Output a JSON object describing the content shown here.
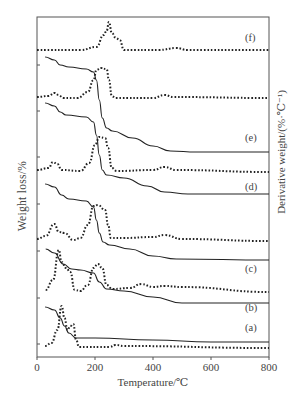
{
  "chart_data": {
    "type": "line",
    "title": "",
    "xlabel": "Temperature/℃",
    "ylabel_left": "Weight loss/%",
    "ylabel_right": "Derivative weight/(%·℃⁻¹)",
    "xlim": [
      0,
      800
    ],
    "x_ticks": [
      0,
      200,
      400,
      600,
      800
    ],
    "grid": false,
    "legend": "inline labels at right end of each curve pair",
    "series": [
      {
        "name": "(f) DTG",
        "style": "dotted",
        "points": [
          [
            0,
            50
          ],
          [
            150,
            50
          ],
          [
            205,
            47
          ],
          [
            230,
            35
          ],
          [
            240,
            31
          ],
          [
            248,
            22
          ],
          [
            258,
            33
          ],
          [
            272,
            38
          ],
          [
            285,
            40
          ],
          [
            300,
            50
          ],
          [
            420,
            50
          ],
          [
            480,
            48
          ],
          [
            520,
            50
          ],
          [
            800,
            50
          ]
        ]
      },
      {
        "name": "(e) TG",
        "style": "solid",
        "points": [
          [
            28,
            57
          ],
          [
            60,
            60
          ],
          [
            80,
            65
          ],
          [
            110,
            67
          ],
          [
            170,
            69
          ],
          [
            195,
            72
          ],
          [
            205,
            80
          ],
          [
            215,
            100
          ],
          [
            225,
            118
          ],
          [
            240,
            128
          ],
          [
            260,
            131
          ],
          [
            330,
            138
          ],
          [
            400,
            146
          ],
          [
            460,
            151
          ],
          [
            550,
            152
          ],
          [
            800,
            152
          ]
        ]
      },
      {
        "name": "(e) DTG",
        "style": "dotted",
        "points": [
          [
            0,
            97
          ],
          [
            40,
            96
          ],
          [
            60,
            93
          ],
          [
            75,
            95
          ],
          [
            90,
            98
          ],
          [
            140,
            98
          ],
          [
            175,
            92
          ],
          [
            195,
            80
          ],
          [
            205,
            70
          ],
          [
            220,
            68
          ],
          [
            240,
            69
          ],
          [
            248,
            80
          ],
          [
            258,
            96
          ],
          [
            270,
            98
          ],
          [
            400,
            98
          ],
          [
            440,
            95
          ],
          [
            470,
            97
          ],
          [
            800,
            98
          ]
        ]
      },
      {
        "name": "(d) TG",
        "style": "solid",
        "points": [
          [
            28,
            103
          ],
          [
            60,
            106
          ],
          [
            80,
            112
          ],
          [
            100,
            115
          ],
          [
            170,
            117
          ],
          [
            195,
            122
          ],
          [
            205,
            135
          ],
          [
            215,
            155
          ],
          [
            225,
            170
          ],
          [
            240,
            175
          ],
          [
            300,
            178
          ],
          [
            380,
            186
          ],
          [
            440,
            192
          ],
          [
            520,
            194
          ],
          [
            800,
            194
          ]
        ]
      },
      {
        "name": "(d) DTG",
        "style": "dotted",
        "points": [
          [
            0,
            170
          ],
          [
            40,
            168
          ],
          [
            55,
            162
          ],
          [
            70,
            164
          ],
          [
            85,
            170
          ],
          [
            150,
            171
          ],
          [
            180,
            163
          ],
          [
            200,
            145
          ],
          [
            215,
            137
          ],
          [
            235,
            138
          ],
          [
            245,
            148
          ],
          [
            258,
            168
          ],
          [
            275,
            171
          ],
          [
            400,
            170
          ],
          [
            440,
            167
          ],
          [
            480,
            170
          ],
          [
            800,
            172
          ]
        ]
      },
      {
        "name": "(c) TG",
        "style": "solid",
        "points": [
          [
            28,
            184
          ],
          [
            60,
            187
          ],
          [
            85,
            195
          ],
          [
            110,
            199
          ],
          [
            170,
            201
          ],
          [
            195,
            207
          ],
          [
            205,
            220
          ],
          [
            215,
            233
          ],
          [
            228,
            242
          ],
          [
            250,
            245
          ],
          [
            320,
            249
          ],
          [
            400,
            256
          ],
          [
            480,
            259
          ],
          [
            800,
            260
          ]
        ]
      },
      {
        "name": "(c) DTG",
        "style": "dotted",
        "points": [
          [
            0,
            239
          ],
          [
            30,
            236
          ],
          [
            60,
            224
          ],
          [
            75,
            232
          ],
          [
            95,
            233
          ],
          [
            125,
            240
          ],
          [
            150,
            238
          ],
          [
            175,
            225
          ],
          [
            195,
            206
          ],
          [
            210,
            205
          ],
          [
            235,
            210
          ],
          [
            245,
            225
          ],
          [
            255,
            238
          ],
          [
            300,
            238
          ],
          [
            400,
            237
          ],
          [
            440,
            235
          ],
          [
            500,
            239
          ],
          [
            800,
            241
          ]
        ]
      },
      {
        "name": "(b) TG",
        "style": "solid",
        "points": [
          [
            30,
            249
          ],
          [
            60,
            253
          ],
          [
            90,
            264
          ],
          [
            120,
            269
          ],
          [
            150,
            270
          ],
          [
            195,
            273
          ],
          [
            215,
            282
          ],
          [
            240,
            289
          ],
          [
            300,
            291
          ],
          [
            400,
            297
          ],
          [
            500,
            303
          ],
          [
            800,
            303
          ]
        ]
      },
      {
        "name": "(b) DTG",
        "style": "dotted",
        "points": [
          [
            30,
            290
          ],
          [
            55,
            280
          ],
          [
            75,
            250
          ],
          [
            85,
            262
          ],
          [
            100,
            268
          ],
          [
            115,
            272
          ],
          [
            130,
            290
          ],
          [
            150,
            291
          ],
          [
            175,
            285
          ],
          [
            195,
            268
          ],
          [
            210,
            264
          ],
          [
            225,
            268
          ],
          [
            240,
            285
          ],
          [
            260,
            289
          ],
          [
            320,
            288
          ],
          [
            360,
            284
          ],
          [
            400,
            287
          ],
          [
            440,
            286
          ],
          [
            500,
            287
          ],
          [
            800,
            292
          ]
        ]
      },
      {
        "name": "(a) TG",
        "style": "solid",
        "points": [
          [
            28,
            307
          ],
          [
            60,
            310
          ],
          [
            80,
            318
          ],
          [
            95,
            326
          ],
          [
            110,
            333
          ],
          [
            135,
            338
          ],
          [
            200,
            338
          ],
          [
            400,
            340
          ],
          [
            600,
            342
          ],
          [
            800,
            342
          ]
        ]
      },
      {
        "name": "(a) DTG",
        "style": "dotted",
        "points": [
          [
            28,
            346
          ],
          [
            50,
            343
          ],
          [
            70,
            330
          ],
          [
            85,
            306
          ],
          [
            95,
            318
          ],
          [
            105,
            330
          ],
          [
            115,
            326
          ],
          [
            125,
            324
          ],
          [
            135,
            340
          ],
          [
            145,
            347
          ],
          [
            250,
            347
          ],
          [
            270,
            345
          ],
          [
            300,
            346
          ],
          [
            800,
            348
          ]
        ]
      }
    ],
    "curve_labels": [
      {
        "text": "(f)",
        "x": 253,
        "y": 40
      },
      {
        "text": "(e)",
        "x": 253,
        "y": 140
      },
      {
        "text": "(d)",
        "x": 253,
        "y": 189
      },
      {
        "text": "(c)",
        "x": 253,
        "y": 271
      },
      {
        "text": "(b)",
        "x": 253,
        "y": 310
      },
      {
        "text": "(a)",
        "x": 253,
        "y": 330
      }
    ]
  },
  "axes": {
    "x_title": "Temperature/℃",
    "y_left_title": "Weight loss/%",
    "y_right_title": "Derivative weight/(%·℃⁻¹)",
    "x_tick_labels": [
      "0",
      "200",
      "400",
      "600",
      "800"
    ]
  },
  "colors": {
    "axis": "#555555",
    "curve": "#222222",
    "text": "#444444"
  }
}
